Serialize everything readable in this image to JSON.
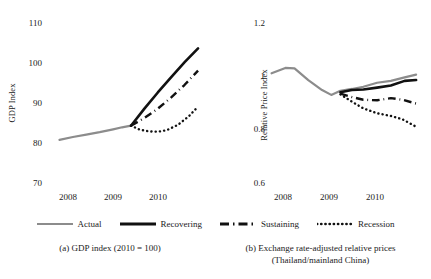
{
  "figure": {
    "legend": {
      "items": [
        {
          "label": "Actual",
          "style": "solid",
          "color": "#8c8c8c",
          "width": 2.2
        },
        {
          "label": "Recovering",
          "style": "solid",
          "color": "#111111",
          "width": 2.6
        },
        {
          "label": "Sustaining",
          "style": "dashdot",
          "color": "#111111",
          "width": 2.4
        },
        {
          "label": "Recession",
          "style": "dotted",
          "color": "#111111",
          "width": 2.4
        }
      ]
    },
    "captions": {
      "a": "(a) GDP index (2010 = 100)",
      "b_line1": "(b) Exchange rate-adjusted relative prices",
      "b_line2": "(Thailand/mainland China)"
    }
  },
  "chart_data": [
    {
      "id": "panel-a",
      "type": "line",
      "title": "",
      "xlabel": "",
      "ylabel": "GDP Index",
      "ylim": [
        70,
        110
      ],
      "yticks": [
        110,
        100,
        90,
        80,
        70
      ],
      "ytick_labels": [
        "110",
        "100",
        "90",
        "80",
        "70"
      ],
      "xlim": [
        2007.6,
        2011.0
      ],
      "xticks": [
        2008,
        2009,
        2010
      ],
      "xtick_labels": [
        "2008",
        "2009",
        "2010"
      ],
      "grid": false,
      "legend_position": "below-figure",
      "series": [
        {
          "name": "Actual",
          "style": "solid",
          "color": "#8c8c8c",
          "x": [
            2007.7,
            2008.0,
            2008.3,
            2008.6,
            2008.9,
            2009.1,
            2009.3
          ],
          "y": [
            80.9,
            81.6,
            82.2,
            82.8,
            83.5,
            84.0,
            84.4
          ]
        },
        {
          "name": "Recovering",
          "style": "solid",
          "color": "#111111",
          "x": [
            2009.3,
            2009.6,
            2009.9,
            2010.2,
            2010.5,
            2010.8
          ],
          "y": [
            84.4,
            88.6,
            92.6,
            96.4,
            100.1,
            103.5
          ]
        },
        {
          "name": "Sustaining",
          "style": "dashdot",
          "color": "#111111",
          "x": [
            2009.3,
            2009.6,
            2009.9,
            2010.2,
            2010.5,
            2010.8
          ],
          "y": [
            84.4,
            86.3,
            88.6,
            91.4,
            94.5,
            98.0
          ]
        },
        {
          "name": "Recession",
          "style": "dotted",
          "color": "#111111",
          "x": [
            2009.3,
            2009.5,
            2009.7,
            2009.9,
            2010.1,
            2010.35,
            2010.6,
            2010.8
          ],
          "y": [
            84.4,
            83.4,
            83.0,
            82.9,
            83.3,
            84.6,
            86.8,
            89.1
          ]
        }
      ]
    },
    {
      "id": "panel-b",
      "type": "line",
      "title": "",
      "xlabel": "",
      "ylabel": "Relative Price Index",
      "ylim": [
        0.6,
        1.2
      ],
      "yticks": [
        1.2,
        1.0,
        0.8,
        0.6
      ],
      "ytick_labels": [
        "1.2",
        "1",
        "0.8",
        "0.6"
      ],
      "xlim": [
        2007.6,
        2011.0
      ],
      "xticks": [
        2008,
        2009,
        2010
      ],
      "xtick_labels": [
        "2008",
        "2009",
        "2010"
      ],
      "grid": false,
      "legend_position": "below-figure",
      "series": [
        {
          "name": "Actual",
          "style": "solid",
          "color": "#8c8c8c",
          "x": [
            2007.7,
            2008.0,
            2008.2,
            2008.5,
            2008.8,
            2009.0,
            2009.2,
            2009.45,
            2009.7,
            2010.0,
            2010.3,
            2010.6,
            2010.85
          ],
          "y": [
            1.01,
            1.03,
            1.028,
            0.985,
            0.948,
            0.93,
            0.945,
            0.952,
            0.96,
            0.975,
            0.982,
            0.995,
            1.005
          ]
        },
        {
          "name": "Recovering",
          "style": "solid",
          "color": "#111111",
          "x": [
            2009.2,
            2009.45,
            2009.7,
            2010.0,
            2010.3,
            2010.6,
            2010.85
          ],
          "y": [
            0.94,
            0.948,
            0.95,
            0.957,
            0.965,
            0.982,
            0.985
          ]
        },
        {
          "name": "Sustaining",
          "style": "dashdot",
          "color": "#111111",
          "x": [
            2009.2,
            2009.45,
            2009.7,
            2010.0,
            2010.3,
            2010.55,
            2010.85
          ],
          "y": [
            0.935,
            0.922,
            0.912,
            0.91,
            0.918,
            0.912,
            0.898
          ]
        },
        {
          "name": "Recession",
          "style": "dotted",
          "color": "#111111",
          "x": [
            2009.2,
            2009.45,
            2009.7,
            2010.0,
            2010.3,
            2010.55,
            2010.85
          ],
          "y": [
            0.932,
            0.905,
            0.88,
            0.862,
            0.852,
            0.84,
            0.812
          ]
        }
      ]
    }
  ]
}
